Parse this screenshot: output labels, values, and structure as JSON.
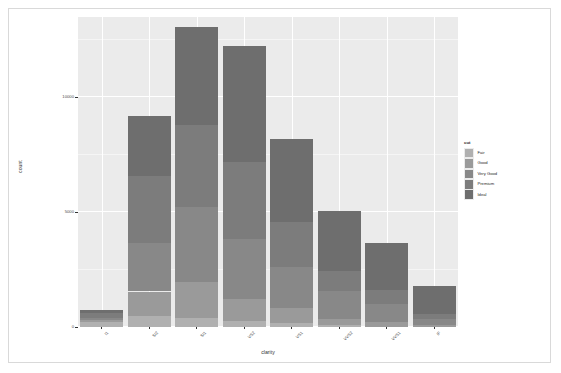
{
  "chart_data": {
    "type": "bar",
    "stacked": true,
    "title": "",
    "subtitle": "",
    "xlabel": "clarity",
    "ylabel": "count",
    "categories": [
      "I1",
      "SI2",
      "SI1",
      "VS2",
      "VS1",
      "VVS2",
      "VVS1",
      "IF"
    ],
    "series": [
      {
        "name": "Fair",
        "color": "#b0b0b0",
        "values": [
          210,
          466,
          408,
          261,
          170,
          69,
          17,
          9
        ]
      },
      {
        "name": "Good",
        "color": "#9a9a9a",
        "values": [
          96,
          1081,
          1560,
          978,
          648,
          286,
          186,
          71
        ]
      },
      {
        "name": "Very Good",
        "color": "#888888",
        "values": [
          84,
          2100,
          3240,
          2591,
          1775,
          1235,
          789,
          268
        ]
      },
      {
        "name": "Premium",
        "color": "#7c7c7c",
        "values": [
          205,
          2949,
          3575,
          3357,
          1989,
          870,
          616,
          230
        ]
      },
      {
        "name": "Ideal",
        "color": "#6e6e6e",
        "values": [
          146,
          2598,
          4282,
          5071,
          3589,
          2606,
          2047,
          1212
        ]
      }
    ],
    "totals": [
      741,
      9194,
      13065,
      12258,
      8171,
      5066,
      3655,
      1790
    ],
    "ylim": [
      0,
      13500
    ],
    "yticks": [
      0,
      5000,
      10000
    ],
    "ytick_labels": [
      "0",
      "5000",
      "10000"
    ],
    "yminor_ticks": [
      2500,
      7500,
      12500
    ],
    "grid": true,
    "legend": {
      "title": "cut",
      "position": "right",
      "entries": [
        "Fair",
        "Good",
        "Very Good",
        "Premium",
        "Ideal"
      ]
    },
    "panel_background": "#ebebeb",
    "gridline_color": "#ffffff",
    "axis_text_color": "#4d4d4d"
  },
  "axes": {
    "x_title": "clarity",
    "y_title": "count"
  },
  "legend": {
    "title": "cut",
    "items": [
      {
        "label": "Fair",
        "color": "#b0b0b0"
      },
      {
        "label": "Good",
        "color": "#9a9a9a"
      },
      {
        "label": "Very Good",
        "color": "#888888"
      },
      {
        "label": "Premium",
        "color": "#7c7c7c"
      },
      {
        "label": "Ideal",
        "color": "#6e6e6e"
      }
    ]
  }
}
